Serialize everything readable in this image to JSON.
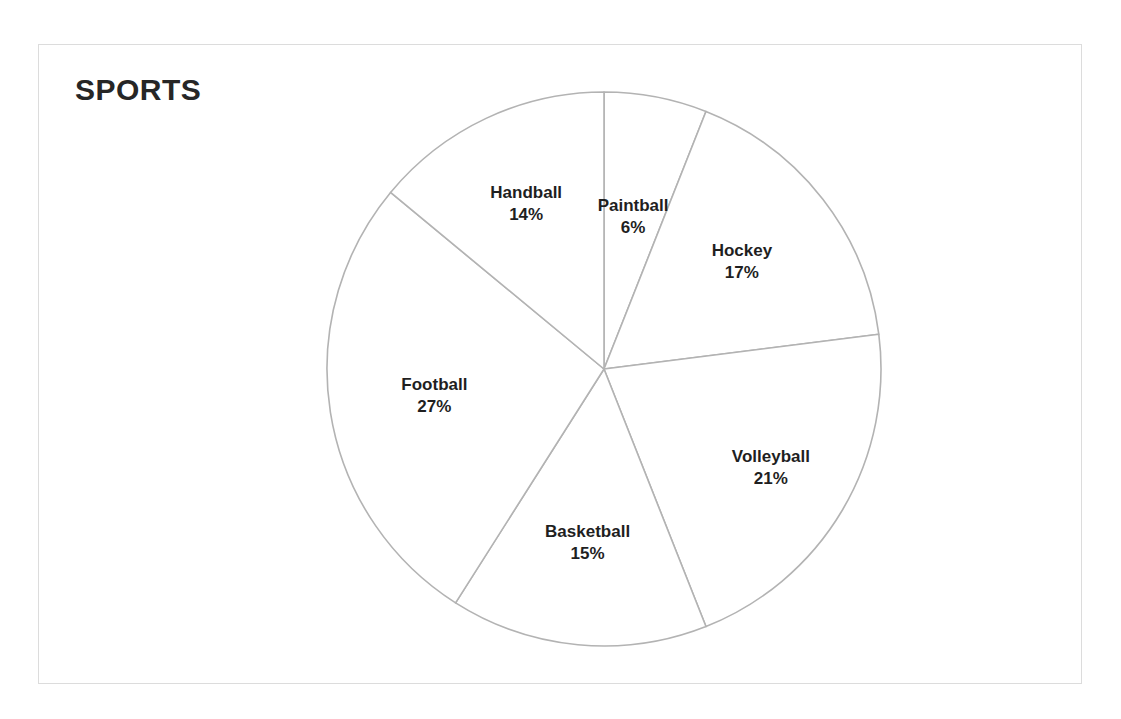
{
  "chart_data": {
    "type": "pie",
    "title": "SPORTS",
    "categories": [
      "Paintball",
      "Hockey",
      "Volleyball",
      "Basketball",
      "Football",
      "Handball"
    ],
    "values": [
      6,
      17,
      21,
      15,
      27,
      14
    ],
    "value_suffix": "%",
    "labels": [
      {
        "name": "Paintball",
        "value": "6%",
        "pct": 6
      },
      {
        "name": "Hockey",
        "value": "17%",
        "pct": 17
      },
      {
        "name": "Volleyball",
        "value": "21%",
        "pct": 21
      },
      {
        "name": "Basketball",
        "value": "15%",
        "pct": 15
      },
      {
        "name": "Football",
        "value": "27%",
        "pct": 27
      },
      {
        "name": "Handball",
        "value": "14%",
        "pct": 14
      }
    ],
    "legend": "none",
    "grid": false,
    "xlabel": "",
    "ylabel": "",
    "start_angle_deg": 0,
    "direction": "clockwise",
    "colors": {
      "slice_fill": "#ffffff",
      "slice_outline": "#b3b3b3",
      "title_text": "#262626",
      "label_text": "#1f1f1f",
      "frame_border": "#dcdcdc",
      "background": "#ffffff"
    }
  },
  "labels_text": {
    "paintball_name": "Paintball",
    "paintball_value": "6%",
    "hockey_name": "Hockey",
    "hockey_value": "17%",
    "volleyball_name": "Volleyball",
    "volleyball_value": "21%",
    "basketball_name": "Basketball",
    "basketball_value": "15%",
    "football_name": "Football",
    "football_value": "27%",
    "handball_name": "Handball",
    "handball_value": "14%"
  }
}
